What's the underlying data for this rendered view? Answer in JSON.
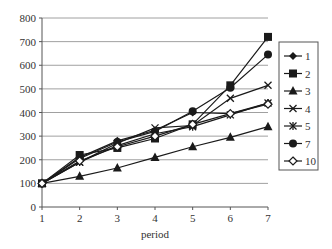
{
  "chart_data": {
    "type": "line",
    "title": "",
    "xlabel": "period",
    "ylabel": "",
    "x": [
      1,
      2,
      3,
      4,
      5,
      6,
      7
    ],
    "ylim": [
      0,
      800
    ],
    "yticks": [
      0,
      100,
      200,
      300,
      400,
      500,
      600,
      700,
      800
    ],
    "xticks": [
      1,
      2,
      3,
      4,
      5,
      6,
      7
    ],
    "grid": "horizontal",
    "legend_position": "right",
    "series": [
      {
        "name": "1",
        "marker": "diamond",
        "values": [
          100,
          210,
          280,
          325,
          400,
          395,
          440
        ]
      },
      {
        "name": "2",
        "marker": "square",
        "values": [
          100,
          220,
          250,
          290,
          350,
          515,
          720
        ]
      },
      {
        "name": "3",
        "marker": "triangle",
        "values": [
          100,
          130,
          165,
          210,
          255,
          295,
          340
        ]
      },
      {
        "name": "4",
        "marker": "x",
        "values": [
          100,
          190,
          270,
          335,
          345,
          460,
          515
        ]
      },
      {
        "name": "5",
        "marker": "star",
        "values": [
          100,
          190,
          260,
          310,
          340,
          390,
          440
        ]
      },
      {
        "name": "7",
        "marker": "circle",
        "values": [
          100,
          205,
          275,
          320,
          405,
          505,
          645
        ]
      },
      {
        "name": "10",
        "marker": "open-diamond",
        "values": [
          100,
          195,
          255,
          300,
          350,
          395,
          435
        ]
      }
    ]
  },
  "colors": {
    "line": "#1a1a1a",
    "grid": "#a0a0a0",
    "axis": "#555555",
    "background": "#ffffff"
  }
}
